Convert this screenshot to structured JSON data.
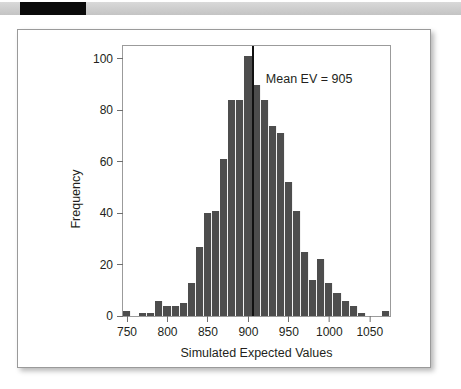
{
  "top_bar": {
    "black_segment_label": "black-marker-strip"
  },
  "chart_data": {
    "type": "bar",
    "title": "",
    "subtitle": "",
    "xlabel": "Simulated Expected Values",
    "ylabel": "Frequency",
    "xlim": [
      745,
      1075
    ],
    "ylim": [
      0,
      105
    ],
    "xticks": [
      750,
      800,
      850,
      900,
      950,
      1000,
      1050
    ],
    "xtick_labels": [
      "750",
      "800",
      "850",
      "900",
      "950",
      "1000",
      "1050"
    ],
    "yticks": [
      0,
      20,
      40,
      60,
      80,
      100
    ],
    "ytick_labels": [
      "0",
      "20",
      "40",
      "60",
      "80",
      "100"
    ],
    "grid": false,
    "legend": "none",
    "bar_color": "#4d4d4d",
    "bin_width": 10,
    "bin_starts": [
      745,
      755,
      765,
      775,
      785,
      795,
      805,
      815,
      825,
      835,
      845,
      855,
      865,
      875,
      885,
      895,
      905,
      915,
      925,
      935,
      945,
      955,
      965,
      975,
      985,
      995,
      1005,
      1015,
      1025,
      1035,
      1045,
      1055,
      1065
    ],
    "categories": [
      "745-755",
      "755-765",
      "765-775",
      "775-785",
      "785-795",
      "795-805",
      "805-815",
      "815-825",
      "825-835",
      "835-845",
      "845-855",
      "855-865",
      "865-875",
      "875-885",
      "885-895",
      "895-905",
      "905-915",
      "915-925",
      "925-935",
      "935-945",
      "945-955",
      "955-965",
      "965-975",
      "975-985",
      "985-995",
      "995-1005",
      "1005-1015",
      "1015-1025",
      "1025-1035",
      "1035-1045",
      "1045-1055",
      "1055-1065",
      "1065-1075"
    ],
    "values": [
      2,
      0,
      1,
      1,
      6,
      4,
      4,
      5,
      13,
      27,
      40,
      41,
      61,
      84,
      84,
      101,
      90,
      84,
      74,
      71,
      52,
      41,
      25,
      14,
      22,
      13,
      9,
      6,
      4,
      1,
      0,
      0,
      2
    ],
    "annotations": [
      {
        "text": "Mean EV = 905",
        "x": 975,
        "y": 92
      }
    ],
    "reference_lines": [
      {
        "label": "mean-line",
        "orientation": "vertical",
        "x": 905,
        "color": "#111111"
      }
    ]
  }
}
